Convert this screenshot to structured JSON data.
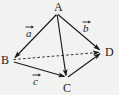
{
  "figure": {
    "kind": "geometry-diagram",
    "background_color": "#f2f2f0",
    "stroke_color": "#1b1b1b",
    "width": 119,
    "height": 95,
    "vertices": [
      {
        "id": "A",
        "label": "A",
        "x": 57,
        "y": 13
      },
      {
        "id": "B",
        "label": "B",
        "x": 12,
        "y": 60
      },
      {
        "id": "C",
        "label": "C",
        "x": 67,
        "y": 78
      },
      {
        "id": "D",
        "label": "D",
        "x": 102,
        "y": 52
      }
    ],
    "edges": [
      {
        "id": "AB",
        "from": "A",
        "to": "B",
        "style": "solid",
        "arrow": "end"
      },
      {
        "id": "AD",
        "from": "A",
        "to": "D",
        "style": "solid",
        "arrow": "end"
      },
      {
        "id": "AC",
        "from": "A",
        "to": "C",
        "style": "solid",
        "arrow": "end"
      },
      {
        "id": "BC",
        "from": "B",
        "to": "C",
        "style": "solid",
        "arrow": "end"
      },
      {
        "id": "CD",
        "from": "C",
        "to": "D",
        "style": "solid",
        "arrow": "end"
      },
      {
        "id": "BD",
        "from": "B",
        "to": "D",
        "style": "dashed",
        "arrow": "end"
      }
    ],
    "vector_labels": [
      {
        "id": "a",
        "label": "a",
        "edge": "AB",
        "accent": "arrow-over",
        "x": 26,
        "y": 25
      },
      {
        "id": "b",
        "label": "b",
        "edge": "AD",
        "accent": "arrow-over",
        "x": 83,
        "y": 20
      },
      {
        "id": "c",
        "label": "c",
        "edge": "BC",
        "accent": "arrow-over",
        "x": 33,
        "y": 73
      }
    ]
  }
}
